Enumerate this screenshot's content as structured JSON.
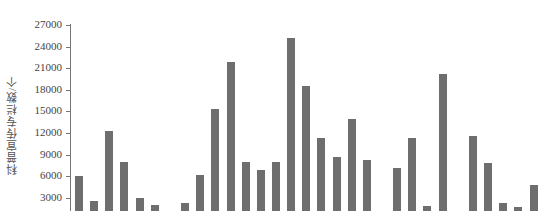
{
  "chart_data": {
    "type": "bar",
    "title": "",
    "xlabel": "",
    "ylabel": "科普宣传专栏数/个",
    "ylim": [
      0,
      27000
    ],
    "yticks": [
      3000,
      6000,
      9000,
      12000,
      15000,
      18000,
      21000,
      24000,
      27000
    ],
    "grid": false,
    "legend": null,
    "bar_color": "#6e6e6e",
    "categories": [
      "1",
      "2",
      "3",
      "4",
      "5",
      "6",
      "7",
      "8",
      "9",
      "10",
      "11",
      "12",
      "13",
      "14",
      "15",
      "16",
      "17",
      "18",
      "19",
      "20",
      "21",
      "22",
      "23",
      "24",
      "25",
      "26",
      "27",
      "28",
      "29",
      "30",
      "31"
    ],
    "values": [
      6000,
      2600,
      12200,
      8000,
      2900,
      2000,
      0,
      2200,
      6100,
      15300,
      21800,
      8000,
      6800,
      8000,
      25200,
      18500,
      11300,
      8700,
      14000,
      8300,
      0,
      7100,
      11300,
      1900,
      20200,
      0,
      11600,
      7800,
      2300,
      1750,
      4800
    ]
  },
  "axis": {
    "ylabel": "科普宣传专栏数/个",
    "tick_labels": [
      "27000",
      "24000",
      "21000",
      "18000",
      "15000",
      "12000",
      "9000",
      "6000",
      "3000"
    ]
  }
}
